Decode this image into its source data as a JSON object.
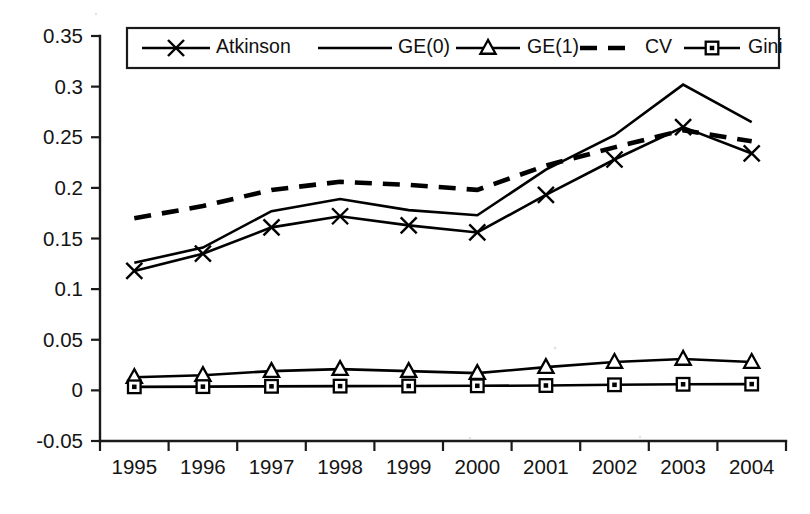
{
  "chart_data": {
    "type": "line",
    "title": "",
    "subtitle": "",
    "xlabel": "",
    "ylabel": "",
    "categories": [
      "1995",
      "1996",
      "1997",
      "1998",
      "1999",
      "2000",
      "2001",
      "2002",
      "2003",
      "2004"
    ],
    "x": [
      1995,
      1996,
      1997,
      1998,
      1999,
      2000,
      2001,
      2002,
      2003,
      2004
    ],
    "xlim": [
      1994.5,
      2004.5
    ],
    "ylim": [
      -0.05,
      0.35
    ],
    "yticks": [
      -0.05,
      0,
      0.05,
      0.1,
      0.15,
      0.2,
      0.25,
      0.3,
      0.35
    ],
    "ytick_labels": [
      "-0.05",
      "0",
      "0.05",
      "0.1",
      "0.15",
      "0.2",
      "0.25",
      "0.3",
      "0.35"
    ],
    "grid": false,
    "legend_position": "top-inside",
    "series": [
      {
        "name": "Atkinson",
        "marker": "x",
        "style": "solid",
        "values": [
          0.118,
          0.135,
          0.161,
          0.172,
          0.163,
          0.156,
          0.193,
          0.228,
          0.26,
          0.234
        ]
      },
      {
        "name": "GE(0)",
        "marker": "none",
        "style": "solid",
        "values": [
          0.126,
          0.141,
          0.177,
          0.189,
          0.178,
          0.173,
          0.218,
          0.252,
          0.302,
          0.265
        ]
      },
      {
        "name": "GE(1)",
        "marker": "triangle",
        "style": "solid",
        "values": [
          0.013,
          0.015,
          0.019,
          0.021,
          0.019,
          0.017,
          0.023,
          0.028,
          0.031,
          0.028
        ]
      },
      {
        "name": "CV",
        "marker": "none",
        "style": "dashed",
        "values": [
          0.17,
          0.182,
          0.198,
          0.206,
          0.203,
          0.198,
          0.222,
          0.24,
          0.257,
          0.246
        ]
      },
      {
        "name": "Gini",
        "marker": "square",
        "style": "solid",
        "values": [
          0.0035,
          0.0037,
          0.004,
          0.0042,
          0.0043,
          0.0045,
          0.0048,
          0.0055,
          0.006,
          0.0062
        ]
      }
    ]
  },
  "legend": {
    "entries": [
      {
        "label": "Atkinson",
        "marker": "x",
        "style": "solid"
      },
      {
        "label": "GE(0)",
        "marker": "none",
        "style": "solid"
      },
      {
        "label": "GE(1)",
        "marker": "triangle",
        "style": "solid"
      },
      {
        "label": "CV",
        "marker": "none",
        "style": "dashed"
      },
      {
        "label": "Gini",
        "marker": "square",
        "style": "solid"
      }
    ]
  },
  "colors": {
    "line": "#000000",
    "axis": "#1a1a1a",
    "text": "#141414",
    "background": "#ffffff"
  }
}
